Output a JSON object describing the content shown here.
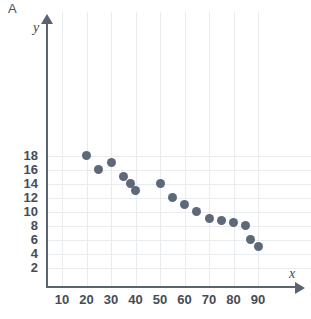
{
  "panel": {
    "letter": "A"
  },
  "chart_data": {
    "type": "scatter",
    "title": "",
    "subtitle": "",
    "xlabel": "x",
    "ylabel": "y",
    "xlim": [
      0,
      95
    ],
    "ylim": [
      0,
      19.5
    ],
    "grid": true,
    "legend": null,
    "legend_position": "none",
    "marker_color": "#5d6879",
    "axis_color": "#5a6472",
    "grid_color": "#e9ecef",
    "xticks": [
      10,
      20,
      30,
      40,
      50,
      60,
      70,
      80,
      90
    ],
    "yticks": [
      2,
      4,
      6,
      8,
      10,
      12,
      14,
      16,
      18
    ],
    "xtick_labels": [
      "10",
      "20",
      "30",
      "40",
      "50",
      "60",
      "70",
      "80",
      "90"
    ],
    "ytick_labels": [
      "2",
      "4",
      "6",
      "8",
      "10",
      "12",
      "14",
      "16",
      "18"
    ],
    "series": [
      {
        "name": "",
        "points": [
          {
            "x": 20,
            "y": 18
          },
          {
            "x": 25,
            "y": 16
          },
          {
            "x": 30,
            "y": 17
          },
          {
            "x": 35,
            "y": 15
          },
          {
            "x": 38,
            "y": 14
          },
          {
            "x": 40,
            "y": 13
          },
          {
            "x": 50,
            "y": 14
          },
          {
            "x": 55,
            "y": 12
          },
          {
            "x": 60,
            "y": 11
          },
          {
            "x": 65,
            "y": 10
          },
          {
            "x": 70,
            "y": 9
          },
          {
            "x": 75,
            "y": 8.7
          },
          {
            "x": 80,
            "y": 8.5
          },
          {
            "x": 85,
            "y": 8
          },
          {
            "x": 87,
            "y": 6
          },
          {
            "x": 90,
            "y": 5
          }
        ]
      }
    ]
  }
}
